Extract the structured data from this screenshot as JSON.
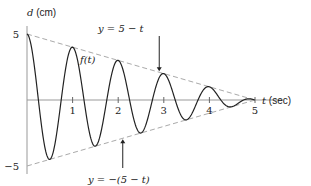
{
  "chart_data": {
    "type": "line",
    "title": "",
    "xlabel": "t (sec)",
    "ylabel": "d (cm)",
    "xlim": [
      0,
      5.6
    ],
    "ylim": [
      -5,
      5
    ],
    "x_ticks": [
      "1",
      "2",
      "3",
      "4",
      "5"
    ],
    "x_tick_values": [
      1,
      2,
      3,
      4,
      5
    ],
    "y_ticks": [
      "5",
      "−5"
    ],
    "y_tick_values": [
      5,
      -5
    ],
    "grid": false,
    "series": [
      {
        "name": "f(t)",
        "formula": "(5 - t) * cos(2*pi*t)",
        "domain": [
          0,
          5
        ],
        "style": "solid"
      },
      {
        "name": "y = 5 − t",
        "formula": "5 - t",
        "domain": [
          0,
          5
        ],
        "style": "dashed"
      },
      {
        "name": "y = −(5 − t)",
        "formula": "-(5 - t)",
        "domain": [
          0,
          5
        ],
        "style": "dashed"
      }
    ],
    "annotations": [
      {
        "text": "y = 5 − t",
        "points_to": "upper envelope",
        "at_t": 2.9
      },
      {
        "text": "f(t)",
        "points_to": "curve",
        "at_t": 1.1
      },
      {
        "text": "y = −(5 − t)",
        "points_to": "lower envelope",
        "at_t": 2.1
      }
    ]
  }
}
